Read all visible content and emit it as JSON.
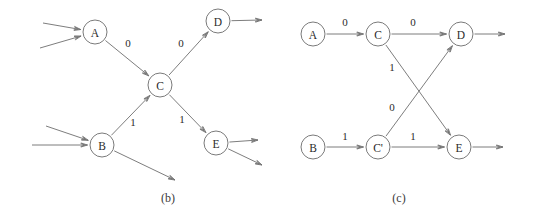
{
  "figure": {
    "background_color": "#ffffff",
    "stroke_color": "#6e6e6e",
    "text_color": "#2b2b2b",
    "panels": [
      {
        "id": "panel-b",
        "caption": "(b)",
        "caption_x": 168,
        "caption_y": 198,
        "nodes": [
          {
            "id": "A",
            "label": "A",
            "cx": 95,
            "cy": 32,
            "r": 12
          },
          {
            "id": "B",
            "label": "B",
            "cx": 102,
            "cy": 145,
            "r": 12
          },
          {
            "id": "C",
            "label": "C",
            "cx": 160,
            "cy": 85,
            "r": 12
          },
          {
            "id": "D",
            "label": "D",
            "cx": 218,
            "cy": 21,
            "r": 12
          },
          {
            "id": "E",
            "label": "E",
            "cx": 216,
            "cy": 143,
            "r": 12
          }
        ],
        "edges": [
          {
            "from": "A",
            "to": "C",
            "label": "0",
            "label_x": 128,
            "label_y": 43
          },
          {
            "from": "C",
            "to": "D",
            "label": "0",
            "label_x": 181,
            "label_y": 43
          },
          {
            "from": "B",
            "to": "C",
            "label": "1",
            "label_x": 133,
            "label_y": 122
          },
          {
            "from": "C",
            "to": "E",
            "label": "1",
            "label_x": 182,
            "label_y": 119
          }
        ],
        "stub_edges_in": [
          {
            "to": "A",
            "from_x": 43,
            "from_y": 23
          },
          {
            "to": "A",
            "from_x": 40,
            "from_y": 48
          },
          {
            "to": "B",
            "from_x": 46,
            "from_y": 126
          },
          {
            "to": "B",
            "from_x": 32,
            "from_y": 145
          }
        ],
        "stub_edges_out": [
          {
            "from": "D",
            "to_x": 262,
            "to_y": 20
          },
          {
            "from": "E",
            "to_x": 258,
            "to_y": 140
          },
          {
            "from": "E",
            "to_x": 262,
            "to_y": 165
          },
          {
            "from": "B",
            "to_x": 175,
            "to_y": 180
          }
        ]
      },
      {
        "id": "panel-c",
        "caption": "(c)",
        "caption_x": 399,
        "caption_y": 198,
        "nodes": [
          {
            "id": "A",
            "label": "A",
            "cx": 313,
            "cy": 34,
            "r": 12
          },
          {
            "id": "C",
            "label": "C",
            "cx": 378,
            "cy": 34,
            "r": 12
          },
          {
            "id": "D",
            "label": "D",
            "cx": 461,
            "cy": 34,
            "r": 12
          },
          {
            "id": "B",
            "label": "B",
            "cx": 313,
            "cy": 147,
            "r": 12
          },
          {
            "id": "Cp",
            "label": "C'",
            "cx": 378,
            "cy": 147,
            "r": 12
          },
          {
            "id": "E",
            "label": "E",
            "cx": 459,
            "cy": 147,
            "r": 12
          }
        ],
        "edges": [
          {
            "from": "A",
            "to": "C",
            "label": "0",
            "label_x": 345,
            "label_y": 22
          },
          {
            "from": "C",
            "to": "D",
            "label": "0",
            "label_x": 413,
            "label_y": 22
          },
          {
            "from": "B",
            "to": "Cp",
            "label": "1",
            "label_x": 345,
            "label_y": 136
          },
          {
            "from": "Cp",
            "to": "E",
            "label": "1",
            "label_x": 413,
            "label_y": 136
          },
          {
            "from": "C",
            "to": "E",
            "label": "1",
            "label_x": 392,
            "label_y": 67
          },
          {
            "from": "Cp",
            "to": "D",
            "label": "0",
            "label_x": 392,
            "label_y": 107
          }
        ],
        "stub_edges_out": [
          {
            "from": "D",
            "to_x": 505,
            "to_y": 34
          },
          {
            "from": "E",
            "to_x": 503,
            "to_y": 147
          }
        ]
      }
    ]
  }
}
